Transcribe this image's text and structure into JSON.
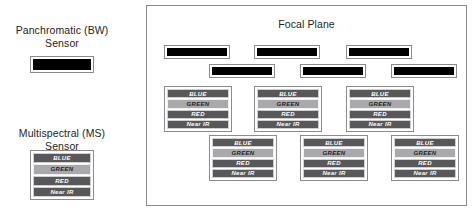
{
  "legend": {
    "panchromatic": {
      "label": "Panchromatic (BW)\nSensor",
      "detector_color": "#000000"
    },
    "multispectral": {
      "label": "Multispectral (MS)\nSensor",
      "bands": [
        {
          "name": "BLUE",
          "tone": "dark"
        },
        {
          "name": "GREEN",
          "tone": "light"
        },
        {
          "name": "RED",
          "tone": "dark"
        },
        {
          "name": "Near IR",
          "tone": "dark"
        }
      ]
    }
  },
  "focal_plane": {
    "title": "Focal Plane",
    "panchromatic_detectors": [
      {
        "id": "pan-1",
        "left": 17,
        "top": 39
      },
      {
        "id": "pan-2",
        "left": 107,
        "top": 39
      },
      {
        "id": "pan-3",
        "left": 199,
        "top": 39
      },
      {
        "id": "pan-4",
        "left": 62,
        "top": 58
      },
      {
        "id": "pan-5",
        "left": 153,
        "top": 58
      },
      {
        "id": "pan-6",
        "left": 244,
        "top": 58
      }
    ],
    "multispectral_detectors": [
      {
        "id": "ms-1",
        "left": 17,
        "top": 80
      },
      {
        "id": "ms-2",
        "left": 107,
        "top": 80
      },
      {
        "id": "ms-3",
        "left": 199,
        "top": 80
      },
      {
        "id": "ms-4",
        "left": 62,
        "top": 129
      },
      {
        "id": "ms-5",
        "left": 153,
        "top": 129
      },
      {
        "id": "ms-6",
        "left": 244,
        "top": 129
      }
    ],
    "band_names": [
      "BLUE",
      "GREEN",
      "RED",
      "Near IR"
    ],
    "band_tones": [
      "dark",
      "light",
      "dark",
      "dark"
    ]
  },
  "colors": {
    "band_dark": "#58585a",
    "band_light": "#a9a9ab",
    "panchromatic": "#000000",
    "panel_border": "#8a8a8c",
    "chip_border": "#8c8c8e",
    "text": "#231f20",
    "background": "#ffffff"
  }
}
